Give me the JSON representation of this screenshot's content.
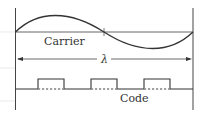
{
  "diagram": {
    "labels": {
      "carrier": "Carrier",
      "wavelength": "λ",
      "code": "Code"
    },
    "colors": {
      "line": "#333333",
      "faint": "#d8d8d8"
    }
  }
}
